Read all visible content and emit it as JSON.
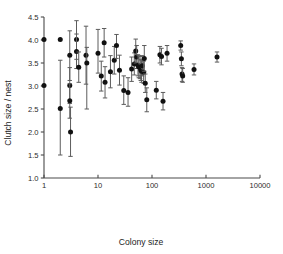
{
  "chart_data": {
    "type": "scatter",
    "title": "",
    "xlabel": "Colony size",
    "ylabel": "Clutch size / nest",
    "xscale": "log",
    "yscale": "linear",
    "xlim": [
      1,
      10000
    ],
    "ylim": [
      1.0,
      4.5
    ],
    "xticks": [
      1,
      10,
      100,
      1000,
      10000
    ],
    "xticklabels": [
      "1",
      "10",
      "100",
      "1000",
      "10000"
    ],
    "yticks": [
      1.0,
      1.5,
      2.0,
      2.5,
      3.0,
      3.5,
      4.0,
      4.5
    ],
    "yticklabels": [
      "1.0",
      "1.5",
      "2.0",
      "2.5",
      "3.0",
      "3.5",
      "4.0",
      "4.5"
    ],
    "grid": false,
    "legend": null,
    "marker": "filled-circle",
    "error_bars": "vertical",
    "series": [
      {
        "name": "Clutch size per nest by colony size",
        "color": "#111111",
        "points": [
          {
            "x": 1.0,
            "y": 4.01,
            "ylow": 4.01,
            "yhigh": 4.01
          },
          {
            "x": 1.0,
            "y": 3.01,
            "ylow": 3.01,
            "yhigh": 3.01
          },
          {
            "x": 2.0,
            "y": 4.01,
            "ylow": 4.01,
            "yhigh": 4.01
          },
          {
            "x": 2.0,
            "y": 2.51,
            "ylow": 1.5,
            "yhigh": 3.56
          },
          {
            "x": 3.0,
            "y": 3.67,
            "ylow": 3.12,
            "yhigh": 4.2
          },
          {
            "x": 3.0,
            "y": 3.01,
            "ylow": 2.62,
            "yhigh": 3.4
          },
          {
            "x": 3.0,
            "y": 2.68,
            "ylow": 2.3,
            "yhigh": 3.05
          },
          {
            "x": 3.1,
            "y": 2.0,
            "ylow": 1.47,
            "yhigh": 2.54
          },
          {
            "x": 4.0,
            "y": 4.01,
            "ylow": 3.58,
            "yhigh": 4.42
          },
          {
            "x": 4.0,
            "y": 3.75,
            "ylow": 3.38,
            "yhigh": 4.13
          },
          {
            "x": 4.4,
            "y": 3.41,
            "ylow": 3.08,
            "yhigh": 3.74
          },
          {
            "x": 6.0,
            "y": 3.67,
            "ylow": 3.04,
            "yhigh": 4.3
          },
          {
            "x": 6.2,
            "y": 3.5,
            "ylow": 2.5,
            "yhigh": 3.84
          },
          {
            "x": 10.0,
            "y": 3.71,
            "ylow": 3.28,
            "yhigh": 4.23
          },
          {
            "x": 11.5,
            "y": 3.22,
            "ylow": 2.89,
            "yhigh": 3.54
          },
          {
            "x": 13.0,
            "y": 3.94,
            "ylow": 3.63,
            "yhigh": 4.25
          },
          {
            "x": 13.5,
            "y": 3.08,
            "ylow": 2.74,
            "yhigh": 3.42
          },
          {
            "x": 17.0,
            "y": 3.31,
            "ylow": 2.96,
            "yhigh": 3.66
          },
          {
            "x": 20.0,
            "y": 3.56,
            "ylow": 3.26,
            "yhigh": 3.86
          },
          {
            "x": 22.0,
            "y": 3.88,
            "ylow": 3.6,
            "yhigh": 4.12
          },
          {
            "x": 25.0,
            "y": 3.34,
            "ylow": 3.02,
            "yhigh": 3.67
          },
          {
            "x": 30.0,
            "y": 2.9,
            "ylow": 2.6,
            "yhigh": 3.22
          },
          {
            "x": 36.0,
            "y": 2.86,
            "ylow": 2.56,
            "yhigh": 3.18
          },
          {
            "x": 42.0,
            "y": 3.37,
            "ylow": 3.1,
            "yhigh": 3.63
          },
          {
            "x": 47.0,
            "y": 3.48,
            "ylow": 3.24,
            "yhigh": 3.72
          },
          {
            "x": 50.0,
            "y": 3.76,
            "ylow": 3.5,
            "yhigh": 4.02
          },
          {
            "x": 52.0,
            "y": 3.63,
            "ylow": 3.38,
            "yhigh": 3.88
          },
          {
            "x": 55.0,
            "y": 3.45,
            "ylow": 3.22,
            "yhigh": 3.68
          },
          {
            "x": 57.0,
            "y": 3.42,
            "ylow": 3.18,
            "yhigh": 3.66
          },
          {
            "x": 60.0,
            "y": 3.4,
            "ylow": 3.16,
            "yhigh": 3.64
          },
          {
            "x": 62.0,
            "y": 3.35,
            "ylow": 3.12,
            "yhigh": 3.58
          },
          {
            "x": 64.0,
            "y": 3.32,
            "ylow": 3.08,
            "yhigh": 3.56
          },
          {
            "x": 66.0,
            "y": 3.44,
            "ylow": 3.22,
            "yhigh": 3.66
          },
          {
            "x": 70.0,
            "y": 3.3,
            "ylow": 3.06,
            "yhigh": 3.54
          },
          {
            "x": 72.0,
            "y": 3.6,
            "ylow": 3.32,
            "yhigh": 3.88
          },
          {
            "x": 75.0,
            "y": 3.06,
            "ylow": 2.86,
            "yhigh": 3.26
          },
          {
            "x": 80.0,
            "y": 2.7,
            "ylow": 2.44,
            "yhigh": 2.96
          },
          {
            "x": 120.0,
            "y": 2.91,
            "ylow": 2.72,
            "yhigh": 3.1
          },
          {
            "x": 140.0,
            "y": 3.68,
            "ylow": 3.5,
            "yhigh": 3.86
          },
          {
            "x": 150.0,
            "y": 3.64,
            "ylow": 3.46,
            "yhigh": 3.82
          },
          {
            "x": 160.0,
            "y": 2.67,
            "ylow": 2.48,
            "yhigh": 2.86
          },
          {
            "x": 190.0,
            "y": 3.71,
            "ylow": 3.54,
            "yhigh": 3.88
          },
          {
            "x": 340.0,
            "y": 3.88,
            "ylow": 3.78,
            "yhigh": 3.98
          },
          {
            "x": 350.0,
            "y": 3.59,
            "ylow": 3.44,
            "yhigh": 3.74
          },
          {
            "x": 360.0,
            "y": 3.26,
            "ylow": 3.1,
            "yhigh": 3.4
          },
          {
            "x": 370.0,
            "y": 3.22,
            "ylow": 3.08,
            "yhigh": 3.38
          },
          {
            "x": 600.0,
            "y": 3.36,
            "ylow": 3.24,
            "yhigh": 3.48
          },
          {
            "x": 1600.0,
            "y": 3.63,
            "ylow": 3.52,
            "yhigh": 3.74
          }
        ]
      }
    ]
  }
}
